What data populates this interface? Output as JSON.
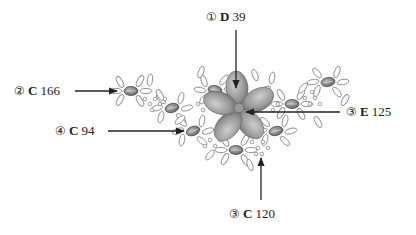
{
  "diagram": {
    "colors": {
      "ink": "#222222",
      "outline": "#8a8a8a",
      "petal_fill": "#9a9a9a",
      "bead_fill": "#7a7a7a",
      "background": "#ffffff"
    },
    "callouts": [
      {
        "id": "top",
        "marker": "①",
        "letter": "D",
        "value": "39"
      },
      {
        "id": "upper-left",
        "marker": "②",
        "letter": "C",
        "value": "166"
      },
      {
        "id": "lower-left",
        "marker": "④",
        "letter": "C",
        "value": "94"
      },
      {
        "id": "right",
        "marker": "③",
        "letter": "E",
        "value": "125"
      },
      {
        "id": "bottom",
        "marker": "③",
        "letter": "C",
        "value": "120"
      }
    ]
  }
}
